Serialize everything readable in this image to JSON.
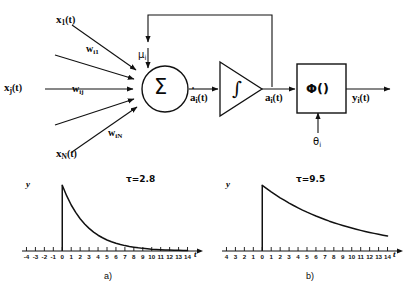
{
  "figure": {
    "line_color": "#111111"
  },
  "diagram": {
    "inputs": [
      {
        "name": "input-x1",
        "label": "x",
        "sub": "1",
        "arg": "(t)",
        "weight_label": "w",
        "weight_sub": "i1"
      },
      {
        "name": "input-xj",
        "label": "x",
        "sub": "j",
        "arg": "(t)",
        "weight_label": "w",
        "weight_sub": "ij"
      },
      {
        "name": "input-xN",
        "label": "x",
        "sub": "N",
        "arg": "(t)",
        "weight_label": "w",
        "weight_sub": "iN"
      }
    ],
    "feedback_label": "μ",
    "feedback_sub": "i",
    "sum_symbol": "Σ",
    "sum_output_label": "a",
    "sum_output_sub": "i",
    "sum_output_arg": "(t)",
    "integrator_symbol": "∫",
    "integrator_output_label": "a",
    "integrator_output_sub": "i",
    "integrator_output_arg": "(t)",
    "activation_symbol": "Φ()",
    "threshold_label": "θ",
    "threshold_sub": "i",
    "output_label": "y",
    "output_sub": "i",
    "output_arg": "(t)"
  },
  "chart_data": [
    {
      "type": "line",
      "name": "panel-a",
      "caption": "a)",
      "title": "τ=2.8",
      "tau": 2.8,
      "xlabel": "t",
      "ylabel": "y",
      "xlim": [
        -4.5,
        14.5
      ],
      "ylim": [
        0,
        1.05
      ],
      "grid": false,
      "legend": "none",
      "xticks": [
        -4,
        -3,
        -2,
        -1,
        0,
        1,
        2,
        3,
        4,
        5,
        6,
        7,
        8,
        9,
        10,
        11,
        12,
        13,
        14
      ],
      "xticklabels": [
        "-4",
        "-3",
        "-2",
        "-1",
        "0",
        "1",
        "2",
        "3",
        "4",
        "5",
        "6",
        "7",
        "8",
        "9",
        "10",
        "11",
        "12",
        "13",
        "14"
      ],
      "x": [
        0,
        0.5,
        1,
        1.5,
        2,
        2.5,
        3,
        3.5,
        4,
        4.5,
        5,
        5.5,
        6,
        6.5,
        7,
        7.5,
        8,
        8.5,
        9,
        9.5,
        10,
        10.5,
        11,
        11.5,
        12,
        12.5,
        13,
        13.5,
        14
      ],
      "values": [
        1.0,
        0.838,
        0.7,
        0.587,
        0.49,
        0.411,
        0.344,
        0.288,
        0.24,
        0.202,
        0.168,
        0.141,
        0.118,
        0.099,
        0.082,
        0.069,
        0.058,
        0.048,
        0.04,
        0.034,
        0.028,
        0.024,
        0.02,
        0.017,
        0.014,
        0.012,
        0.01,
        0.008,
        0.007
      ]
    },
    {
      "type": "line",
      "name": "panel-b",
      "caption": "b)",
      "title": "τ=9.5",
      "tau": 9.5,
      "xlabel": "t",
      "ylabel": "y",
      "xlim": [
        -4.5,
        14.5
      ],
      "ylim": [
        0,
        1.05
      ],
      "grid": false,
      "legend": "none",
      "xticks": [
        -4,
        -3,
        -2,
        -1,
        0,
        1,
        2,
        3,
        4,
        5,
        6,
        7,
        8,
        9,
        10,
        11,
        12,
        13,
        14
      ],
      "xticklabels": [
        "4",
        "3",
        "2",
        "1",
        "0",
        "1",
        "2",
        "3",
        "4",
        "5",
        "6",
        "7",
        "8",
        "9",
        "10",
        "11",
        "12",
        "13",
        "14"
      ],
      "x": [
        0,
        0.5,
        1,
        1.5,
        2,
        2.5,
        3,
        3.5,
        4,
        4.5,
        5,
        5.5,
        6,
        6.5,
        7,
        7.5,
        8,
        8.5,
        9,
        9.5,
        10,
        10.5,
        11,
        11.5,
        12,
        12.5,
        13,
        13.5,
        14
      ],
      "values": [
        1.0,
        0.949,
        0.9,
        0.854,
        0.81,
        0.769,
        0.729,
        0.692,
        0.657,
        0.623,
        0.591,
        0.561,
        0.532,
        0.505,
        0.479,
        0.454,
        0.431,
        0.409,
        0.388,
        0.368,
        0.349,
        0.331,
        0.314,
        0.298,
        0.283,
        0.268,
        0.254,
        0.241,
        0.229
      ]
    }
  ]
}
